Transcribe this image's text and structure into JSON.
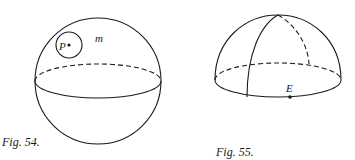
{
  "figures": [
    {
      "caption": "Fig. 54.",
      "description": "Sphere with equator; small circle around point P on the surface m",
      "labels": {
        "point": "P",
        "surface": "m"
      }
    },
    {
      "caption": "Fig. 55.",
      "description": "Hemisphere (dome) with equatorial base and a meridian; point E on the equator",
      "labels": {
        "point": "E"
      }
    }
  ],
  "colors": {
    "stroke": "#1a1a1a",
    "background": "#ffffff"
  }
}
